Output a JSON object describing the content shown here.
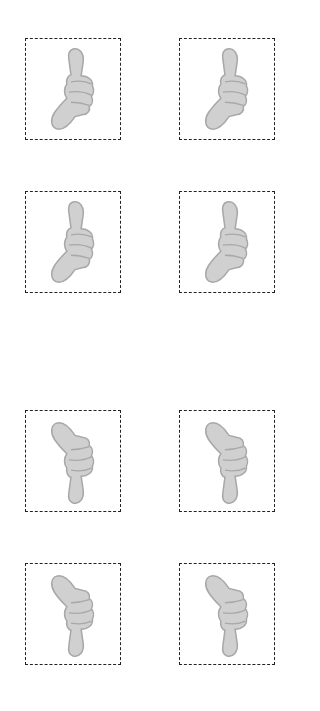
{
  "cards": [
    {
      "type": "thumbs-up",
      "row": 1,
      "col": 1
    },
    {
      "type": "thumbs-up",
      "row": 1,
      "col": 2
    },
    {
      "type": "thumbs-up",
      "row": 2,
      "col": 1
    },
    {
      "type": "thumbs-up",
      "row": 2,
      "col": 2
    },
    {
      "type": "thumbs-down",
      "row": 3,
      "col": 1
    },
    {
      "type": "thumbs-down",
      "row": 3,
      "col": 2
    },
    {
      "type": "thumbs-down",
      "row": 4,
      "col": 1
    },
    {
      "type": "thumbs-down",
      "row": 4,
      "col": 2
    }
  ],
  "colors": {
    "hand_fill": "#d0d0d0",
    "hand_stroke": "#a8a8a8",
    "border": "#222222"
  }
}
